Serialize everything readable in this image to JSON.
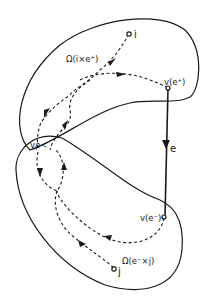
{
  "diagram": {
    "type": "path-decomposition-figure",
    "regions": [
      {
        "id": "upper-region",
        "description": "upper kidney-shaped closed curve"
      },
      {
        "id": "lower-region",
        "description": "lower kidney-shaped closed curve"
      }
    ],
    "nodes": {
      "i": {
        "label": "i"
      },
      "j": {
        "label": "j"
      },
      "v_e_plus": {
        "label": "v(e⁺)"
      },
      "v_e_minus": {
        "label": "v(e⁻)"
      },
      "v_p": {
        "label": "vρ<"
      }
    },
    "edge": {
      "label": "e",
      "from": "v(e⁺)",
      "to": "v(e⁻)"
    },
    "path_labels": {
      "upper": "Ω(i×e⁺)",
      "lower": "Ω(e⁻×j)"
    }
  }
}
